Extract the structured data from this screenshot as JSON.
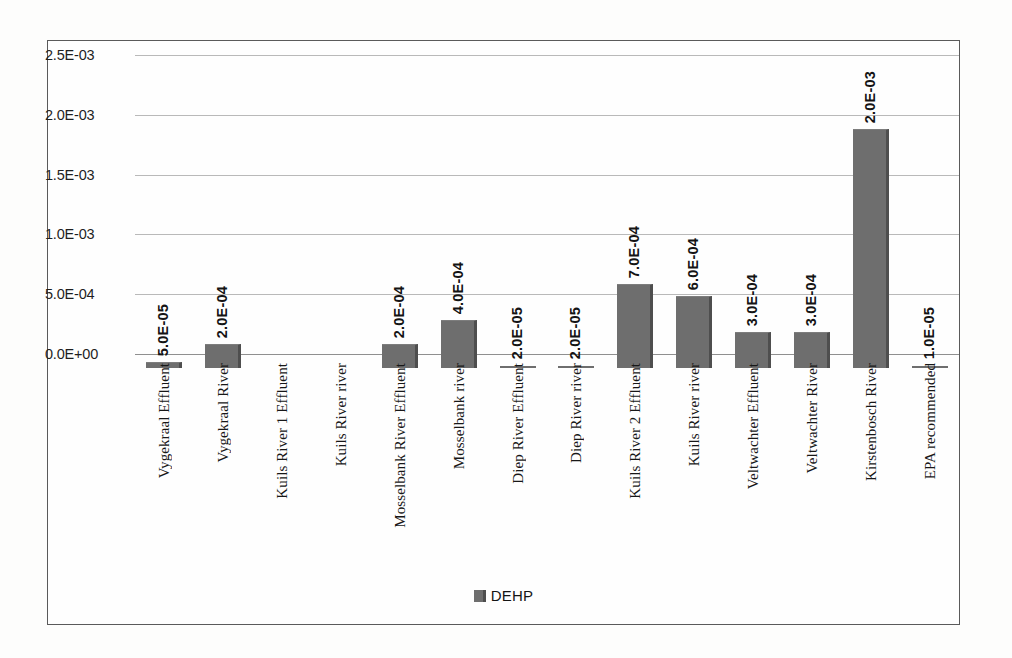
{
  "chart_data": {
    "type": "bar",
    "title": "",
    "xlabel": "",
    "ylabel": "",
    "ylim": [
      0,
      0.0025
    ],
    "ytick_labels": [
      "2.5E-03",
      "2.0E-03",
      "1.5E-03",
      "1.0E-03",
      "5.0E-04",
      "0.0E+00"
    ],
    "ytick_values": [
      0.0025,
      0.002,
      0.0015,
      0.001,
      0.0005,
      0
    ],
    "grid": true,
    "legend_position": "bottom",
    "series": [
      {
        "name": "DEHP",
        "color": "#6e6e6e",
        "values": [
          5e-05,
          0.0002,
          0,
          0,
          0.0002,
          0.0004,
          2e-05,
          2e-05,
          0.0007,
          0.0006,
          0.0003,
          0.0003,
          0.002,
          1e-05
        ],
        "data_labels": [
          "5.0E-05",
          "2.0E-04",
          "",
          "",
          "2.0E-04",
          "4.0E-04",
          "2.0E-05",
          "2.0E-05",
          "7.0E-04",
          "6.0E-04",
          "3.0E-04",
          "3.0E-04",
          "2.0E-03",
          "1.0E-05"
        ]
      }
    ],
    "categories": [
      "Vygekraal Effluent",
      "Vygekraal River",
      "Kuils River 1 Effluent",
      "Kuils River river",
      "Mosselbank River Effluent",
      "Mosselbank river",
      "Diep River Effluent",
      "Diep River river",
      "Kuils River 2 Effluent",
      "Kuils River river",
      "Veltwachter Effluent",
      "Veltwachter River",
      "Kirstenbosch River",
      "EPA recommended"
    ]
  },
  "legend": {
    "label": "DEHP",
    "swatch_color": "#6e6e6e"
  }
}
